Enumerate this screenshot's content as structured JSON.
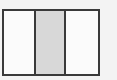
{
  "diagram": {
    "type": "fraction-bar",
    "total_parts": 3,
    "shaded_parts": 1,
    "shaded_index": 1,
    "colors": {
      "border": "#3a3a3a",
      "shaded": "#d8d8d8",
      "unshaded": "#fbfbfb",
      "background": "#f3f3f3"
    }
  }
}
